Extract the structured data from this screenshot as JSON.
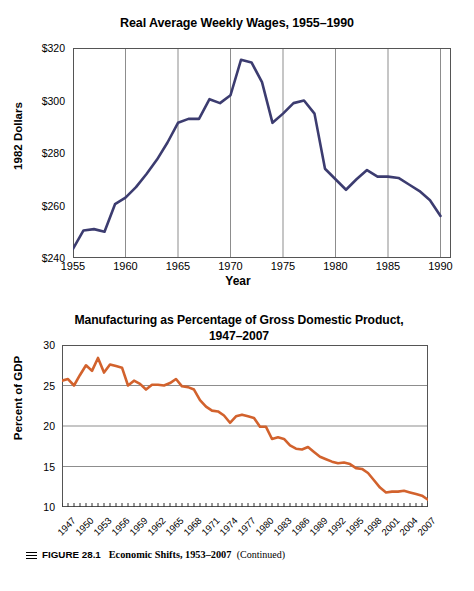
{
  "figure": {
    "caption": {
      "menu_icon": "hamburger-icon",
      "label": "FIGURE 28.1",
      "title": "Economic Shifts, 1953–2007",
      "continued": "(Continued)"
    }
  },
  "chart_data": [
    {
      "type": "line",
      "title": "Real Average Weekly Wages, 1955–1990",
      "xlabel": "Year",
      "ylabel": "1982 Dollars",
      "xlim": [
        1955,
        1991
      ],
      "ylim": [
        240,
        320
      ],
      "ytick_labels": [
        "$240",
        "$260",
        "$280",
        "$300",
        "$320"
      ],
      "yticks": [
        240,
        260,
        280,
        300,
        320
      ],
      "xtick_labels": [
        "1955",
        "1960",
        "1965",
        "1970",
        "1975",
        "1980",
        "1985",
        "1990"
      ],
      "xticks": [
        1955,
        1960,
        1965,
        1970,
        1975,
        1980,
        1985,
        1990
      ],
      "grid": "vertical",
      "legend": "none",
      "line_color": "#3c3c70",
      "x": [
        1955,
        1956,
        1957,
        1958,
        1959,
        1960,
        1961,
        1962,
        1963,
        1964,
        1965,
        1966,
        1967,
        1968,
        1969,
        1970,
        1971,
        1972,
        1973,
        1974,
        1975,
        1976,
        1977,
        1978,
        1979,
        1980,
        1981,
        1982,
        1983,
        1984,
        1985,
        1986,
        1987,
        1988,
        1989,
        1990
      ],
      "values": [
        243.5,
        250.5,
        251,
        250,
        260.5,
        263,
        267,
        272,
        277.5,
        284,
        291.5,
        293,
        293,
        300.5,
        299,
        302,
        315.5,
        314.5,
        307,
        291.5,
        295,
        299,
        300,
        295,
        274,
        270,
        266,
        270,
        273.5,
        271,
        271,
        270.5,
        268,
        265.5,
        262,
        256
      ]
    },
    {
      "type": "line",
      "title": "Manufacturing as Percentage of Gross Domestic Product, 1947–2007",
      "xlabel": "",
      "ylabel": "Percent of GDP",
      "xlim": [
        1947,
        2008
      ],
      "ylim": [
        10,
        30
      ],
      "ytick_labels": [
        "10",
        "15",
        "20",
        "25",
        "30"
      ],
      "yticks": [
        10,
        15,
        20,
        25,
        30
      ],
      "xtick_labels": [
        "1947",
        "1950",
        "1953",
        "1956",
        "1959",
        "1962",
        "1965",
        "1968",
        "1971",
        "1974",
        "1977",
        "1980",
        "1983",
        "1986",
        "1989",
        "1992",
        "1995",
        "1998",
        "2001",
        "2004",
        "2007"
      ],
      "xticks": [
        1947,
        1950,
        1953,
        1956,
        1959,
        1962,
        1965,
        1968,
        1971,
        1974,
        1977,
        1980,
        1983,
        1986,
        1989,
        1992,
        1995,
        1998,
        2001,
        2004,
        2007
      ],
      "grid": "horizontal",
      "legend": "none",
      "line_color": "#d2622d",
      "x": [
        1947,
        1948,
        1949,
        1950,
        1951,
        1952,
        1953,
        1954,
        1955,
        1956,
        1957,
        1958,
        1959,
        1960,
        1961,
        1962,
        1963,
        1964,
        1965,
        1966,
        1967,
        1968,
        1969,
        1970,
        1971,
        1972,
        1973,
        1974,
        1975,
        1976,
        1977,
        1978,
        1979,
        1980,
        1981,
        1982,
        1983,
        1984,
        1985,
        1986,
        1987,
        1988,
        1989,
        1990,
        1991,
        1992,
        1993,
        1994,
        1995,
        1996,
        1997,
        1998,
        1999,
        2000,
        2001,
        2002,
        2003,
        2004,
        2005,
        2006,
        2007,
        2008
      ],
      "values": [
        25.6,
        25.8,
        25.0,
        26.3,
        27.5,
        26.8,
        28.4,
        26.6,
        27.6,
        27.4,
        27.2,
        25.0,
        25.6,
        25.2,
        24.5,
        25.1,
        25.1,
        25.0,
        25.3,
        25.8,
        24.9,
        24.8,
        24.5,
        23.2,
        22.4,
        21.9,
        21.8,
        21.3,
        20.4,
        21.2,
        21.4,
        21.2,
        21.0,
        19.9,
        19.9,
        18.4,
        18.6,
        18.4,
        17.6,
        17.2,
        17.1,
        17.4,
        16.8,
        16.2,
        15.9,
        15.6,
        15.4,
        15.5,
        15.3,
        14.8,
        14.7,
        14.2,
        13.3,
        12.4,
        11.8,
        11.9,
        11.9,
        12.0,
        11.8,
        11.6,
        11.4,
        10.9
      ]
    }
  ]
}
